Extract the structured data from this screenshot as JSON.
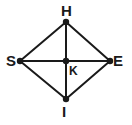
{
  "figure": {
    "name": "quadrilateral-with-diagonals",
    "canvas": {
      "width": 132,
      "height": 125
    },
    "background_color": "#ffffff",
    "line_color": "#1a1a1a",
    "label_color": "#1a1a1a",
    "line_width": 2,
    "vertex_dot_radius": 3.2,
    "points": [
      {
        "id": "H",
        "label": "H",
        "x": 66,
        "y": 22,
        "role": "top-vertex"
      },
      {
        "id": "S",
        "label": "S",
        "x": 20,
        "y": 61,
        "role": "left-vertex"
      },
      {
        "id": "E",
        "label": "E",
        "x": 110,
        "y": 61,
        "role": "right-vertex"
      },
      {
        "id": "I",
        "label": "I",
        "x": 66,
        "y": 99,
        "role": "bottom-vertex"
      },
      {
        "id": "K",
        "label": "K",
        "x": 66,
        "y": 61,
        "role": "diagonal-intersection"
      }
    ],
    "segments": [
      {
        "id": "SH",
        "from": "S",
        "to": "H",
        "type": "side"
      },
      {
        "id": "HE",
        "from": "H",
        "to": "E",
        "type": "side"
      },
      {
        "id": "EI",
        "from": "E",
        "to": "I",
        "type": "side"
      },
      {
        "id": "IS",
        "from": "I",
        "to": "S",
        "type": "side"
      },
      {
        "id": "SE",
        "from": "S",
        "to": "E",
        "type": "diagonal"
      },
      {
        "id": "HI",
        "from": "H",
        "to": "I",
        "type": "diagonal"
      }
    ],
    "labels": {
      "H": "H",
      "S": "S",
      "E": "E",
      "I": "I",
      "K": "K"
    }
  }
}
